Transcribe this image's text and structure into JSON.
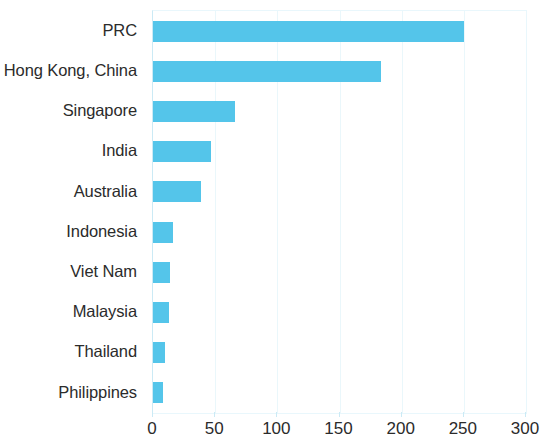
{
  "chart_data": {
    "type": "bar",
    "orientation": "horizontal",
    "title": "",
    "subtitle": "",
    "xlabel": "",
    "ylabel": "",
    "categories": [
      "PRC",
      "Hong Kong, China",
      "Singapore",
      "India",
      "Australia",
      "Indonesia",
      "Viet Nam",
      "Malaysia",
      "Thailand",
      "Philippines"
    ],
    "values": [
      250,
      183,
      66,
      47,
      39,
      16,
      14,
      13,
      10,
      8
    ],
    "xlim": [
      0,
      300
    ],
    "xticks": [
      0,
      50,
      100,
      150,
      200,
      250,
      300
    ],
    "xtick_labels": [
      "0",
      "50",
      "100",
      "150",
      "200",
      "250",
      "300"
    ],
    "grid": true,
    "grid_axis": "x",
    "legend": null,
    "legend_position": "none",
    "bar_color": "#54c5ea",
    "grid_color": "#eaf7fb",
    "axis_color": "#cbeaf5",
    "text_color": "#2b2b2b",
    "background": "#ffffff",
    "annotations": []
  }
}
